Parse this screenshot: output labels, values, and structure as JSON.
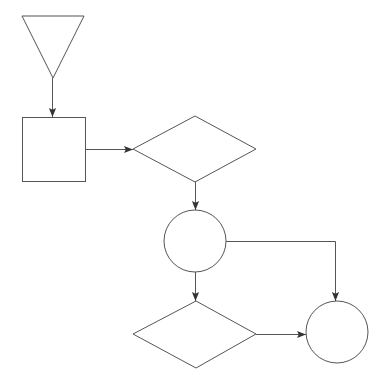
{
  "diagram": {
    "type": "flowchart",
    "stroke_color": "#555555",
    "background": "#ffffff",
    "nodes": [
      {
        "id": "start",
        "shape": "inverted-triangle",
        "label": ""
      },
      {
        "id": "process",
        "shape": "rectangle",
        "label": ""
      },
      {
        "id": "decision1",
        "shape": "diamond",
        "label": ""
      },
      {
        "id": "connector1",
        "shape": "circle",
        "label": ""
      },
      {
        "id": "decision2",
        "shape": "diamond",
        "label": ""
      },
      {
        "id": "connector2",
        "shape": "circle",
        "label": ""
      }
    ],
    "edges": [
      {
        "from": "start",
        "to": "process",
        "label": ""
      },
      {
        "from": "process",
        "to": "decision1",
        "label": ""
      },
      {
        "from": "decision1",
        "to": "connector1",
        "label": ""
      },
      {
        "from": "connector1",
        "to": "decision2",
        "label": ""
      },
      {
        "from": "connector1",
        "to": "connector2",
        "label": ""
      },
      {
        "from": "decision2",
        "to": "connector2",
        "label": ""
      }
    ]
  }
}
